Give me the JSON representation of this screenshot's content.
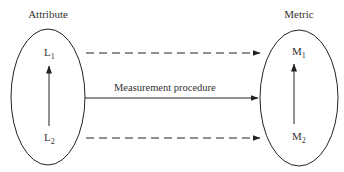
{
  "diagram": {
    "attribute": {
      "title": "Attribute",
      "top_label": "L",
      "top_sub": "1",
      "bottom_label": "L",
      "bottom_sub": "2"
    },
    "metric": {
      "title": "Metric",
      "top_label": "M",
      "top_sub": "1",
      "bottom_label": "M",
      "bottom_sub": "2"
    },
    "arrow_label": "Measurement procedure",
    "colors": {
      "stroke": "#222222",
      "text": "#333333",
      "background": "#ffffff"
    }
  }
}
